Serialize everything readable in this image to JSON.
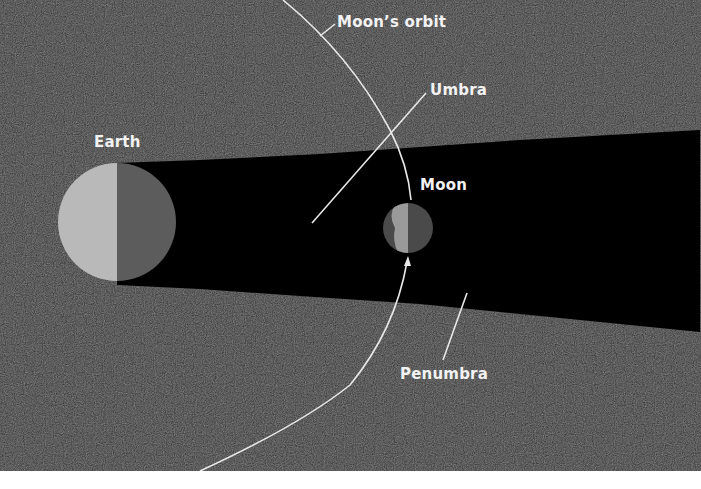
{
  "diagram": {
    "type": "lunar-eclipse-geometry",
    "colors": {
      "space_background": "#2b2b2b",
      "umbra": "#000000",
      "bottom_band": "#ffffff",
      "earth_lit": "#b9b9b9",
      "earth_dark": "#5c5c5c",
      "moon_lit": "#9a9a9a",
      "moon_dark": "#4a4a4a",
      "lines": "#e8e8e8",
      "text": "#f2f2f2"
    },
    "labels": {
      "earth": "Earth",
      "moon": "Moon",
      "moons_orbit": "Moon’s orbit",
      "umbra": "Umbra",
      "penumbra": "Penumbra"
    },
    "bodies": {
      "earth": {
        "cx": 117,
        "cy": 222,
        "r": 59
      },
      "moon": {
        "cx": 408,
        "cy": 228,
        "r": 25
      }
    },
    "shadow": {
      "top_edge": [
        [
          140,
          162
        ],
        [
          700,
          130
        ]
      ],
      "bottom_edge": [
        [
          117,
          285
        ],
        [
          700,
          332
        ]
      ]
    }
  }
}
